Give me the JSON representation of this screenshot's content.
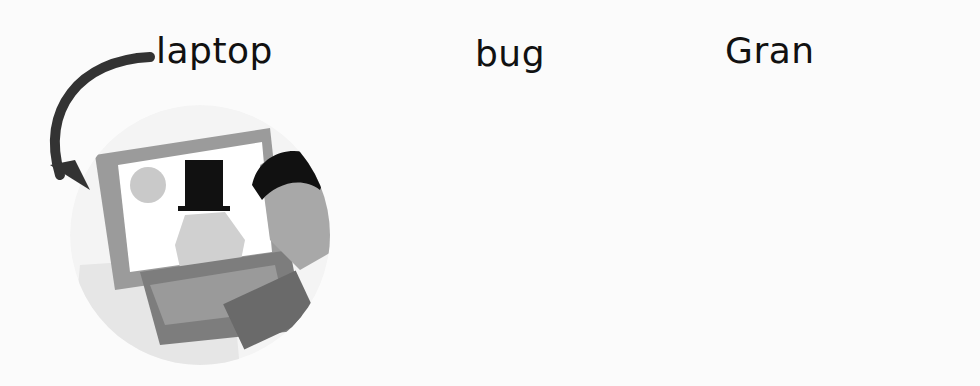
{
  "panels": [
    {
      "word": "laptop",
      "subject": "person typing on a laptop showing a cat in a top hat"
    },
    {
      "word": "bug",
      "subject": "cartoon bug with wings and a dashed flight trail"
    },
    {
      "word": "Gran",
      "subject": "grandmother with hair bun and round glasses"
    }
  ],
  "colors": {
    "arrow": "#333333",
    "background": "#fbfbfb",
    "text": "#111111"
  }
}
